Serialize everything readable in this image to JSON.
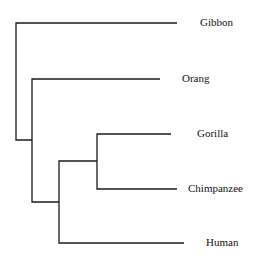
{
  "diagram": {
    "type": "phylogenetic-tree",
    "taxa": [
      {
        "name": "Gibbon"
      },
      {
        "name": "Orang"
      },
      {
        "name": "Gorilla"
      },
      {
        "name": "Chimpanzee"
      },
      {
        "name": "Human"
      }
    ],
    "topology": "(Gibbon,(Orang,((Gorilla,Chimpanzee),Human)))"
  }
}
